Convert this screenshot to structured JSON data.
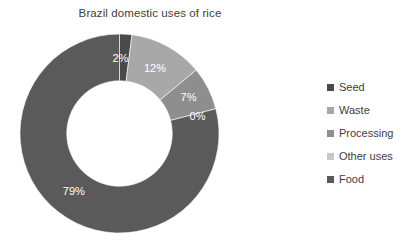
{
  "chart_data": {
    "type": "pie",
    "variant": "donut",
    "title": "Brazil domestic uses of rice",
    "xlabel": "",
    "ylabel": "",
    "grid": false,
    "legend_position": "right",
    "units": "percent",
    "start_angle_deg": 0,
    "direction": "clockwise",
    "inner_radius_ratio": 0.53,
    "categories": [
      "Seed",
      "Waste",
      "Processing",
      "Other uses",
      "Food"
    ],
    "values": [
      2,
      12,
      7,
      0,
      79
    ],
    "data_labels": [
      "2%",
      "12%",
      "7%",
      "0%",
      "79%"
    ],
    "colors": [
      "#4a4a4a",
      "#a8a8a8",
      "#8e8e8e",
      "#c9c9c9",
      "#5a5a5a"
    ],
    "slices": [
      {
        "name": "Seed",
        "value": 2,
        "label": "2%",
        "color": "#4a4a4a"
      },
      {
        "name": "Waste",
        "value": 12,
        "label": "12%",
        "color": "#a8a8a8"
      },
      {
        "name": "Processing",
        "value": 7,
        "label": "7%",
        "color": "#8e8e8e"
      },
      {
        "name": "Other uses",
        "value": 0,
        "label": "0%",
        "color": "#c9c9c9"
      },
      {
        "name": "Food",
        "value": 79,
        "label": "79%",
        "color": "#5a5a5a"
      }
    ]
  },
  "title": {
    "text": "Brazil domestic uses of rice"
  },
  "legend": {
    "items": [
      {
        "label": "Seed",
        "color": "#4a4a4a"
      },
      {
        "label": "Waste",
        "color": "#a8a8a8"
      },
      {
        "label": "Processing",
        "color": "#8e8e8e"
      },
      {
        "label": "Other uses",
        "color": "#c9c9c9"
      },
      {
        "label": "Food",
        "color": "#5a5a5a"
      }
    ]
  },
  "labels": {
    "seed": "2%",
    "waste": "12%",
    "processing": "7%",
    "other_uses": "0%",
    "food": "79%"
  }
}
